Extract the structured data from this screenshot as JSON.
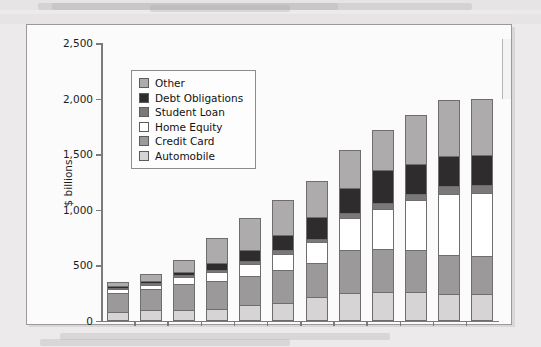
{
  "chart_data": {
    "type": "bar",
    "stacked": true,
    "title": "",
    "xlabel": "",
    "ylabel": "$ billions",
    "ylim": [
      0,
      2500
    ],
    "yticks": [
      0,
      500,
      1000,
      1500,
      2000,
      2500
    ],
    "ytick_labels": [
      "0",
      "500",
      "1,000",
      "1,500",
      "2,000",
      "2,500"
    ],
    "grid": false,
    "legend_position": "upper left",
    "categories": [
      "1995",
      "1996",
      "1997",
      "1998",
      "1999",
      "2000",
      "2001",
      "2002",
      "2003",
      "2004",
      "2005",
      "2006"
    ],
    "series": [
      {
        "name": "Automobile",
        "color": "#d6d4d4",
        "values": [
          60,
          75,
          80,
          90,
          120,
          140,
          195,
          230,
          240,
          240,
          225,
          220
        ]
      },
      {
        "name": "Credit Card",
        "color": "#9b9999",
        "values": [
          170,
          190,
          230,
          250,
          265,
          300,
          305,
          390,
          390,
          375,
          350,
          345
        ]
      },
      {
        "name": "Home Equity",
        "color": "#ffffff",
        "values": [
          35,
          40,
          65,
          80,
          105,
          145,
          185,
          285,
          360,
          450,
          550,
          565
        ]
      },
      {
        "name": "Student Loan",
        "color": "#7a7878",
        "values": [
          10,
          12,
          15,
          20,
          25,
          30,
          35,
          45,
          55,
          60,
          65,
          70
        ]
      },
      {
        "name": "Debt Obligations",
        "color": "#2e2c2c",
        "values": [
          15,
          20,
          30,
          60,
          105,
          135,
          195,
          225,
          290,
          270,
          275,
          275
        ]
      },
      {
        "name": "Other",
        "color": "#adabab",
        "values": [
          35,
          60,
          110,
          230,
          285,
          315,
          325,
          345,
          360,
          435,
          500,
          505
        ]
      }
    ],
    "totals": [
      325,
      397,
      530,
      730,
      905,
      1065,
      1240,
      1520,
      1695,
      1830,
      1965,
      1980
    ],
    "legend_entries": [
      {
        "label": "Other",
        "color": "#adabab"
      },
      {
        "label": "Debt Obligations",
        "color": "#2e2c2c"
      },
      {
        "label": "Student Loan",
        "color": "#7a7878"
      },
      {
        "label": "Home Equity",
        "color": "#ffffff"
      },
      {
        "label": "Credit Card",
        "color": "#9b9999"
      },
      {
        "label": "Automobile",
        "color": "#d6d4d4"
      }
    ]
  }
}
